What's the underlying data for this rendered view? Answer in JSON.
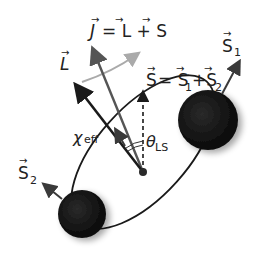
{
  "diagram": {
    "labels": {
      "J": "J",
      "J_eq": "= L + S",
      "L": "L",
      "S": "S",
      "S_eq": "= S",
      "S1_sub": "1",
      "plus": "+S",
      "S2_sub": "2",
      "S1": "S",
      "S1_index": "1",
      "S2": "S",
      "S2_index": "2",
      "chi": "χ",
      "chi_sub": "eff",
      "theta": "θ",
      "theta_sub": "LS"
    },
    "colors": {
      "black_hole": "#111111",
      "J_arrow": "#555555",
      "L_arrow": "#1a1a1a",
      "precession_arrow": "#a9a9a9",
      "orbit": "#1a1a1a"
    }
  }
}
